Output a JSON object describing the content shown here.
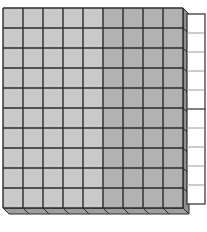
{
  "diagram": {
    "type": "base-ten-blocks",
    "flat": {
      "columns": 9,
      "rows": 10,
      "light_columns": 5,
      "colors": {
        "light": "#c9c9c9",
        "dark": "#b2b2b2",
        "side": "#8f8f8f",
        "bottom": "#9e9e9e",
        "grid": "#2a2a2a"
      }
    },
    "rod": {
      "cells": 10,
      "color": "#ffffff",
      "border": "#2a2a2a",
      "divider": "#9a9a9a"
    }
  }
}
